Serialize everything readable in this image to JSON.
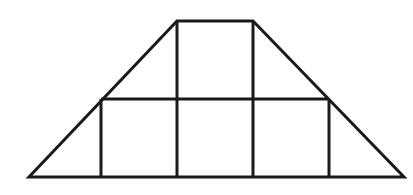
{
  "diagram": {
    "type": "trapezoid-grid",
    "stroke_color": "#1a1a1a",
    "stroke_width": 3,
    "background": "#ffffff",
    "outline": {
      "top_left": [
        177,
        21
      ],
      "top_right": [
        253,
        21
      ],
      "bottom_right": [
        404,
        177
      ],
      "bottom_left": [
        29,
        177
      ]
    },
    "middle_line": {
      "y": 99,
      "x1": 101,
      "x2": 329
    },
    "inner_verticals": [
      {
        "x": 177,
        "y1": 21,
        "y2": 177
      },
      {
        "x": 253,
        "y1": 21,
        "y2": 177
      },
      {
        "x": 101,
        "y1": 99,
        "y2": 177
      },
      {
        "x": 329,
        "y1": 99,
        "y2": 177
      }
    ],
    "regions": {
      "squares": 4,
      "triangles": 4
    }
  }
}
